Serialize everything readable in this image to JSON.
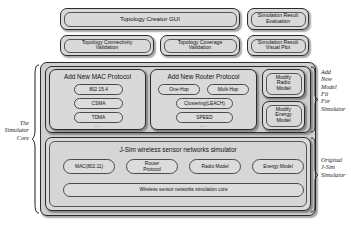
{
  "diagram": {
    "top_row": [
      {
        "id": "topology-creator-gui",
        "label": "Topology Creator GUI"
      },
      {
        "id": "simulation-result-evaluation",
        "label": "Simulation Result\nEvaluation"
      }
    ],
    "second_row": [
      {
        "id": "topology-connectivity-validation",
        "label": "Topology Connectivity\nValidation"
      },
      {
        "id": "topology-coverage-validation",
        "label": "Topology Coverage\nValidation"
      },
      {
        "id": "simulation-result-visual-plot",
        "label": "Simulation Result\nVisual Plot"
      }
    ],
    "mac_group": {
      "id": "add-new-mac-protocol",
      "title": "Add New MAC Protocol",
      "items": [
        "802.15.4",
        "CSMA",
        "TDMA"
      ],
      "ellipsis": "..."
    },
    "router_group": {
      "id": "add-new-router-protocol",
      "title": "Add New Router Protocol",
      "items_row1": [
        "One-Hop",
        "Multi-Hop"
      ],
      "items_row2": [
        "Clustering(LEACH)",
        "SPEED"
      ],
      "ellipsis": "..."
    },
    "modify_models": [
      {
        "id": "modify-radio-model",
        "label": "Modify\nRadio\nModel"
      },
      {
        "id": "modify-energy-model",
        "label": "Modify\nEnergy\nModel"
      }
    ],
    "jsim_core": {
      "id": "jsim-wireless-sensor-networks-simulator",
      "title": "J-Sim wireless sensor networks simulator",
      "modules": [
        "MAC(802.11)",
        "Router\nProtocol",
        "Radio Model",
        "Energy Model"
      ],
      "base_layer": "Wireless sensor networks simulation core"
    },
    "annotations": {
      "left": "The\nSimulator\nCore",
      "right_top": "Add\nNew\nModel\nFit\nFor\nSimulator",
      "right_bottom": "Original\nJ-Sim\nSimulator"
    },
    "colors": {
      "page_background": "#ffffff",
      "box_fill": "#d9d9d9",
      "container_fill": "#cfcfcf",
      "pill_fill": "#dcdcdc",
      "border": "#2b2b2b",
      "text": "#111111"
    }
  }
}
